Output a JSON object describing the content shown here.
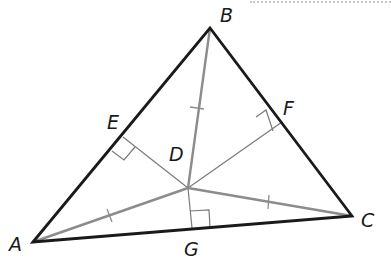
{
  "diagram": {
    "colors": {
      "triangle": "#1a1a1a",
      "segments_to_vertices": "#8c8c8c",
      "perpendiculars": "#7a7a7a",
      "right_angle_marks": "#7a7a7a",
      "background": "#ffffff"
    },
    "vertices": {
      "A": {
        "label": "A",
        "x": 33,
        "y": 242
      },
      "B": {
        "label": "B",
        "x": 210,
        "y": 28
      },
      "C": {
        "label": "C",
        "x": 352,
        "y": 216
      }
    },
    "interior_point": {
      "label": "D",
      "x": 188,
      "y": 188
    },
    "feet": {
      "E": {
        "label": "E",
        "x": 123,
        "y": 137,
        "on_side": "AB"
      },
      "F": {
        "label": "F",
        "x": 282,
        "y": 122,
        "on_side": "BC"
      },
      "G": {
        "label": "G",
        "x": 192,
        "y": 228,
        "on_side": "AC"
      }
    },
    "congruent_segments": [
      "DA",
      "DB",
      "DC"
    ],
    "right_angles_at": [
      "E",
      "F",
      "G"
    ],
    "labels": {
      "A": "A",
      "B": "B",
      "C": "C",
      "D": "D",
      "E": "E",
      "F": "F",
      "G": "G"
    }
  }
}
